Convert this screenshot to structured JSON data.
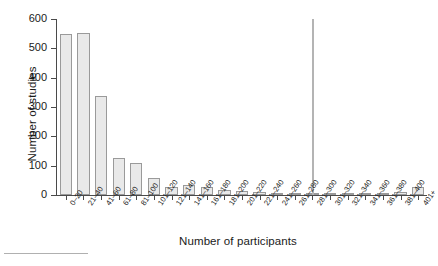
{
  "chart_data": {
    "type": "bar",
    "title": "",
    "xlabel": "Number of participants",
    "ylabel": "Number of studies",
    "ylim": [
      0,
      600
    ],
    "yticks": [
      0,
      100,
      200,
      300,
      400,
      500,
      600
    ],
    "grid": false,
    "legend": "none",
    "categories": [
      "0–20",
      "21–40",
      "41–60",
      "61–80",
      "81–100",
      "101–120",
      "121–140",
      "141–160",
      "161–180",
      "181–200",
      "201–220",
      "221–240",
      "241–260",
      "261–280",
      "281–300",
      "301–320",
      "321–340",
      "341–360",
      "361–380",
      "381–400",
      "401+"
    ],
    "values": [
      548,
      553,
      337,
      127,
      110,
      57,
      28,
      33,
      27,
      16,
      13,
      11,
      8,
      6,
      5,
      4,
      3,
      4,
      3,
      9,
      29
    ],
    "annotations": [
      {
        "name": "vertical-spike-line",
        "category": "281–300",
        "value": 600,
        "note": "tall thin vertical line rising to the top of the axis"
      }
    ],
    "colors": {
      "bar_fill": "#e9e9e9",
      "bar_stroke": "#9a9a9a",
      "axis": "#4a4a4a",
      "text": "#1a1a1a",
      "spike": "#b4b4b4"
    }
  }
}
